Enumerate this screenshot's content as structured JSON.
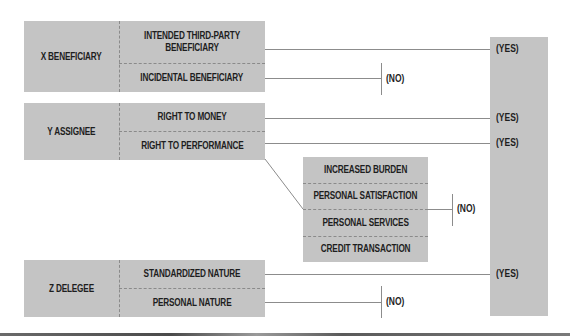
{
  "colors": {
    "box_fill": "#c4c4c4",
    "text": "#1e1e1e",
    "connector": "#8c8c8c",
    "divider": "#8a8a8a"
  },
  "groups": [
    {
      "party": "X BENEFICIARY",
      "items": [
        {
          "label": "INTENDED THIRD-PARTY BENEFICIARY",
          "outcome": "(YES)"
        },
        {
          "label": "INCIDENTAL BENEFICIARY",
          "outcome": "(NO)"
        }
      ]
    },
    {
      "party": "Y ASSIGNEE",
      "items": [
        {
          "label": "RIGHT TO MONEY",
          "outcome": "(YES)"
        },
        {
          "label": "RIGHT TO PERFORMANCE",
          "outcome": "(YES)"
        }
      ]
    },
    {
      "party": "Z DELEGEE",
      "items": [
        {
          "label": "STANDARDIZED NATURE",
          "outcome": "(YES)"
        },
        {
          "label": "PERSONAL NATURE",
          "outcome": "(NO)"
        }
      ]
    }
  ],
  "exceptions": {
    "items": [
      "INCREASED BURDEN",
      "PERSONAL SATISFACTION",
      "PERSONAL SERVICES",
      "CREDIT TRANSACTION"
    ],
    "outcome": "(NO)"
  },
  "yes_column": {
    "labels": [
      "(YES)",
      "(YES)",
      "(YES)",
      "(YES)"
    ]
  }
}
